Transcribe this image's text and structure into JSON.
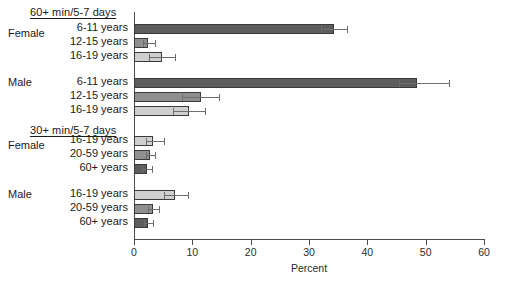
{
  "chart_data": {
    "type": "bar",
    "orientation": "horizontal",
    "title": "",
    "xlabel": "Percent",
    "ylabel": "",
    "xlim": [
      0,
      60
    ],
    "xticks": [
      0,
      10,
      20,
      30,
      40,
      50,
      60
    ],
    "grid": false,
    "legend": "none",
    "groups": [
      {
        "header": "60+ min/5-7 days",
        "subgroups": [
          {
            "sex": "Female",
            "rows": [
              {
                "category": "6-11 years",
                "value": 34.2,
                "err_low": 32.1,
                "err_high": 36.5,
                "shade": "dark"
              },
              {
                "category": "12-15 years",
                "value": 2.4,
                "err_low": 1.5,
                "err_high": 3.6,
                "shade": "mid"
              },
              {
                "category": "16-19 years",
                "value": 4.8,
                "err_low": 2.6,
                "err_high": 7.0,
                "shade": "light"
              }
            ]
          },
          {
            "sex": "Male",
            "rows": [
              {
                "category": "6-11 years",
                "value": 48.5,
                "err_low": 45.5,
                "err_high": 54.0,
                "shade": "dark"
              },
              {
                "category": "12-15 years",
                "value": 11.5,
                "err_low": 8.3,
                "err_high": 14.6,
                "shade": "mid"
              },
              {
                "category": "16-19 years",
                "value": 9.4,
                "err_low": 6.7,
                "err_high": 12.1,
                "shade": "light"
              }
            ]
          }
        ]
      },
      {
        "header": "30+ min/5-7 days",
        "subgroups": [
          {
            "sex": "Female",
            "rows": [
              {
                "category": "16-19 years",
                "value": 3.3,
                "err_low": 2.1,
                "err_high": 5.1,
                "shade": "light"
              },
              {
                "category": "20-59 years",
                "value": 2.8,
                "err_low": 2.1,
                "err_high": 3.6,
                "shade": "mid"
              },
              {
                "category": "60+ years",
                "value": 2.2,
                "err_low": 1.4,
                "err_high": 3.1,
                "shade": "dark"
              }
            ]
          },
          {
            "sex": "Male",
            "rows": [
              {
                "category": "16-19 years",
                "value": 7.0,
                "err_low": 5.2,
                "err_high": 9.3,
                "shade": "light"
              },
              {
                "category": "20-59 years",
                "value": 3.2,
                "err_low": 2.4,
                "err_high": 4.2,
                "shade": "mid"
              },
              {
                "category": "60+ years",
                "value": 2.4,
                "err_low": 1.7,
                "err_high": 3.3,
                "shade": "dark"
              }
            ]
          }
        ]
      }
    ]
  },
  "colors": {
    "bar_dark": "#5d5d5d",
    "bar_mid": "#8f8f8f",
    "bar_light": "#cfcfcf",
    "axis": "#4d4d4d",
    "error_bar": "#6e6e6e",
    "background": "#ffffff"
  },
  "layout": {
    "axis_x0": 134,
    "axis_x60": 484,
    "plot_top": 12,
    "plot_bottom": 239
  }
}
